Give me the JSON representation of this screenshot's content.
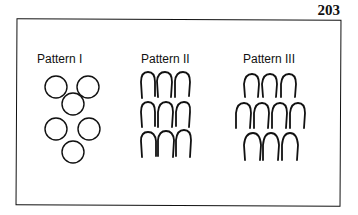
{
  "page_number": "203",
  "figure": {
    "patterns": [
      {
        "label": "Pattern I",
        "shape": "circle",
        "rows": [
          2,
          1,
          2,
          1
        ]
      },
      {
        "label": "Pattern II",
        "shape": "arch",
        "rows": [
          3,
          3,
          3
        ]
      },
      {
        "label": "Pattern III",
        "shape": "arch",
        "rows": [
          3,
          4,
          3
        ]
      }
    ]
  }
}
